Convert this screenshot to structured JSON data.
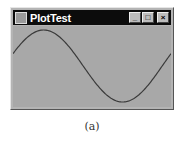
{
  "window": {
    "title": "PlotTest",
    "icon": "java-cup-icon",
    "controls": {
      "minimize": "_",
      "maximize": "□",
      "close": "×"
    }
  },
  "plot": {
    "curve": "sine",
    "line_color": "#3a3a3a",
    "background": "#a8a8a8"
  },
  "caption": "(a)"
}
